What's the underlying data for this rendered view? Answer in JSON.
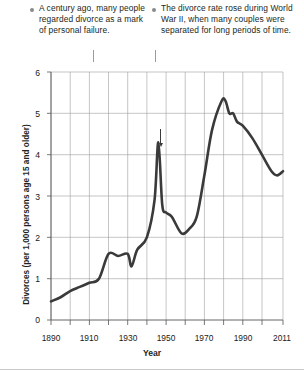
{
  "annotations": [
    {
      "id": "annotation-stigma",
      "bullet": "bullet-icon",
      "text": "A century ago, many people regarded divorce as a mark of personal failure."
    },
    {
      "id": "annotation-wwii",
      "bullet": "bullet-icon",
      "text": "The divorce rate rose during World War II, when many couples were separated for long periods of time."
    }
  ],
  "chart_data": {
    "type": "line",
    "title": "",
    "xlabel": "Year",
    "ylabel": "Divorces (per 1,000 persons age 15 and older)",
    "xlim": [
      1890,
      2011
    ],
    "ylim": [
      0,
      6
    ],
    "grid": true,
    "legend": "none",
    "x_major_ticks": [
      1890,
      1910,
      1930,
      1950,
      1970,
      1990,
      2011
    ],
    "x_tick_labels": [
      "1890",
      "1910",
      "1930",
      "1950",
      "1970",
      "1990",
      "2011"
    ],
    "x_minor_tick_interval": 10,
    "y_ticks": [
      0,
      1,
      2,
      3,
      4,
      5,
      6
    ],
    "y_tick_labels": [
      "0",
      "1",
      "2",
      "3",
      "4",
      "5",
      "6"
    ],
    "line_color": "#3a3a3a",
    "series": [
      {
        "name": "Divorce rate",
        "x": [
          1890,
          1895,
          1900,
          1905,
          1910,
          1915,
          1920,
          1925,
          1930,
          1932,
          1935,
          1940,
          1944,
          1946,
          1948,
          1950,
          1953,
          1958,
          1962,
          1966,
          1970,
          1974,
          1979,
          1981,
          1983,
          1985,
          1987,
          1990,
          1995,
          2000,
          2005,
          2008,
          2011
        ],
        "values": [
          0.45,
          0.55,
          0.7,
          0.8,
          0.9,
          1.0,
          1.6,
          1.55,
          1.6,
          1.3,
          1.7,
          2.0,
          2.9,
          4.3,
          2.8,
          2.6,
          2.5,
          2.1,
          2.2,
          2.5,
          3.5,
          4.6,
          5.3,
          5.3,
          5.0,
          5.0,
          4.8,
          4.7,
          4.4,
          4.0,
          3.6,
          3.5,
          3.6
        ]
      }
    ],
    "annotated_points": [
      {
        "label": "World War II peak",
        "x": 1946,
        "y": 4.3
      }
    ]
  }
}
